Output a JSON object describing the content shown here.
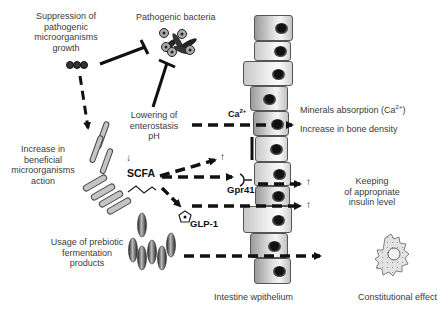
{
  "diagram": {
    "labels": {
      "suppression": [
        "Suppression of",
        "pathogenic",
        "microorganisms",
        "growth"
      ],
      "pathogenic_bacteria": "Pathogenic bacteria",
      "lowering_ph": [
        "Lowering of",
        "enterostasis",
        "pH"
      ],
      "increase_beneficial": [
        "Increase in",
        "beneficial",
        "microorganisms",
        "action"
      ],
      "scfa": "SCFA",
      "scfa_arrow": "↓",
      "gpr41": "Gpr41",
      "glp1": "GLP-1",
      "ca": "Ca",
      "ca_sup": "2+",
      "usage_prebiotic": [
        "Usage of prebiotic",
        "fermentation",
        "products"
      ],
      "minerals_absorption": "Minerals absorption (Ca",
      "minerals_sup": "2+",
      "minerals_close": ")",
      "bone_density": "Increase in bone density",
      "insulin": [
        "Keeping",
        "of appropriate",
        "insulin level"
      ],
      "intestine": "Intestine wpithelium",
      "constitutional": "Constitutional effect",
      "up_arrow": "↑"
    },
    "colors": {
      "line": "#111111",
      "text": "#3a3a3a",
      "cell_border": "#555555"
    }
  }
}
